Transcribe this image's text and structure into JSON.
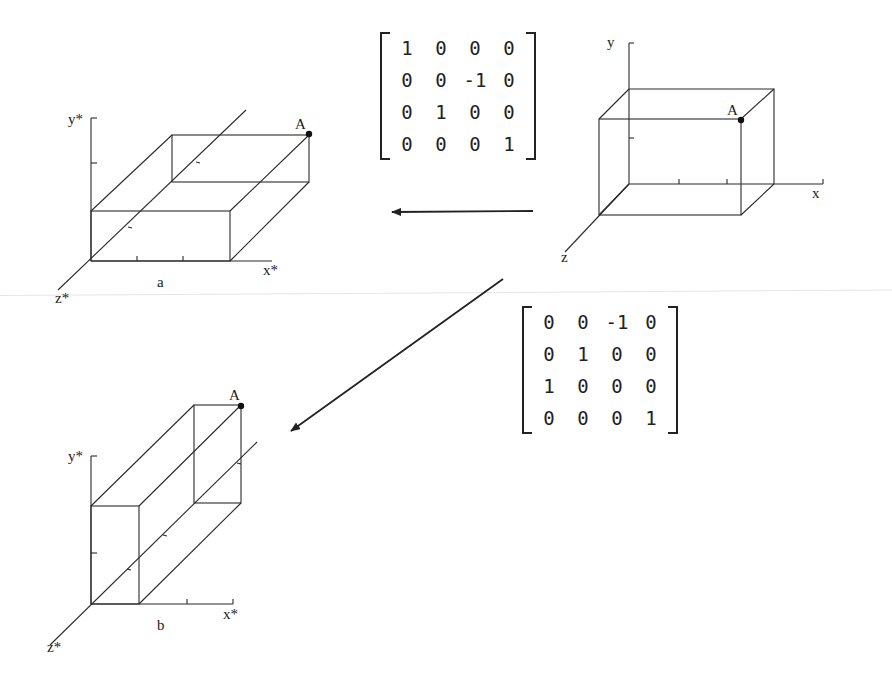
{
  "figures": {
    "original": {
      "y_label": "y",
      "x_label": "x",
      "z_label": "z",
      "point_label": "A"
    },
    "rotated_x": {
      "y_label": "y*",
      "x_label": "x*",
      "z_label": "z*",
      "point_label": "A",
      "dim_label": "a"
    },
    "rotated_y": {
      "y_label": "y*",
      "x_label": "x*",
      "z_label": "z*",
      "point_label": "A",
      "dim_label": "b"
    }
  },
  "matrices": {
    "rotation_x": [
      [
        "1",
        "0",
        "0",
        "0"
      ],
      [
        "0",
        "0",
        "-1",
        "0"
      ],
      [
        "0",
        "1",
        "0",
        "0"
      ],
      [
        "0",
        "0",
        "0",
        "1"
      ]
    ],
    "rotation_y": [
      [
        "0",
        "0",
        "-1",
        "0"
      ],
      [
        "0",
        "1",
        "0",
        "0"
      ],
      [
        "1",
        "0",
        "0",
        "0"
      ],
      [
        "0",
        "0",
        "0",
        "1"
      ]
    ]
  },
  "colors": {
    "ink": "#222222",
    "background": "#ffffff"
  }
}
